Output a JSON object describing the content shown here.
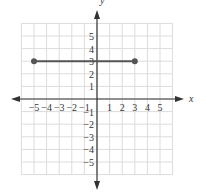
{
  "chart_data": {
    "type": "line",
    "title": "",
    "xlabel": "x",
    "ylabel": "y",
    "xlim": [
      -6,
      6
    ],
    "ylim": [
      -6,
      6
    ],
    "grid": true,
    "x_ticks": [
      -5,
      -4,
      -3,
      -2,
      -1,
      1,
      2,
      3,
      4,
      5
    ],
    "y_ticks": [
      5,
      4,
      3,
      2,
      1,
      -1,
      -2,
      -3,
      -4,
      -5
    ],
    "x_tick_labels": [
      "−5",
      "−4",
      "−3",
      "−2",
      "−1",
      "1",
      "2",
      "3",
      "4",
      "5"
    ],
    "y_tick_labels": [
      "5",
      "4",
      "3",
      "2",
      "1",
      "−1",
      "−2",
      "−3",
      "−4",
      "−5"
    ],
    "series": [
      {
        "name": "segment",
        "kind": "line-segment",
        "points": [
          [
            -5,
            3
          ],
          [
            3,
            3
          ]
        ],
        "endpoints": "closed",
        "color": "#555555"
      }
    ]
  },
  "colors": {
    "grid": "#dcdcdc",
    "axis": "#333333",
    "segment": "#555555"
  }
}
